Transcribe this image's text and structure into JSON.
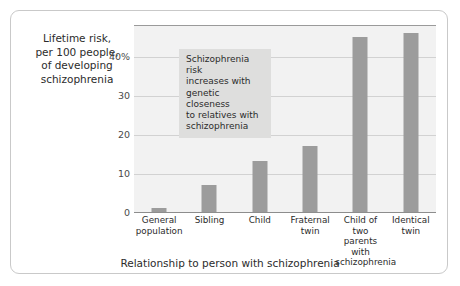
{
  "chart_data": {
    "type": "bar",
    "title": "",
    "ylabel": "Lifetime risk, per 100 people, of developing schizophrenia",
    "xlabel": "Relationship to person with schizophrenia",
    "categories": [
      "General population",
      "Sibling",
      "Child",
      "Fraternal twin",
      "Child of two parents with schizophrenia",
      "Identical twin"
    ],
    "values": [
      1,
      7,
      13,
      17,
      45,
      46
    ],
    "ylim": [
      0,
      48
    ],
    "yticks": [
      0,
      10,
      20,
      30,
      40
    ],
    "ytick_labels": [
      "0",
      "10",
      "20",
      "30",
      "40%"
    ],
    "grid": "horizontal",
    "legend": "none",
    "annotations": [
      "Schizophrenia risk increases with genetic closeness to relatives with schizophrenia"
    ],
    "bar_color": "#9c9c9c",
    "plot_background": "#f2f2f2"
  },
  "axis": {
    "y_caption_lines": [
      "Lifetime risk,",
      "per 100 people,",
      "of developing",
      "schizophrenia"
    ],
    "y_tick_labels": [
      "40%",
      "30",
      "20",
      "10",
      "0"
    ],
    "x_title": "Relationship to person with schizophrenia"
  },
  "categories_display": [
    [
      "General",
      "population"
    ],
    [
      "Sibling"
    ],
    [
      "Child"
    ],
    [
      "Fraternal",
      "twin"
    ],
    [
      "Child of two",
      "parents with",
      "schizophrenia"
    ],
    [
      "Identical",
      "twin"
    ]
  ],
  "annotation": {
    "lines": [
      "Schizophrenia risk",
      "increases with",
      "genetic closeness",
      "to relatives with",
      "schizophrenia"
    ]
  }
}
